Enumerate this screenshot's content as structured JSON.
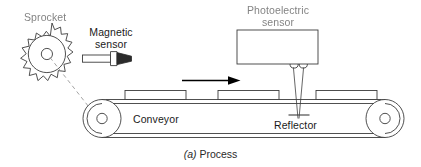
{
  "figure": {
    "caption_prefix": "(a)",
    "caption_text": "Process",
    "caption_full": "(a) Process"
  },
  "labels": {
    "sprocket": "Sprocket",
    "magnetic_sensor_line1": "Magnetic",
    "magnetic_sensor_line2": "sensor",
    "photoelectric_line1": "Photoelectric",
    "photoelectric_line2": "sensor",
    "conveyor": "Conveyor",
    "reflector": "Reflector"
  },
  "components": {
    "sprocket_teeth": 18,
    "conveyor_packages": 3,
    "conveyor_pulleys": 2,
    "direction_arrow": "right",
    "beam_rays": 2
  },
  "colors": {
    "line": "#3c3c3c",
    "text": "#1a1a1a",
    "dashed": "#8a8a8a",
    "arrow": "#000000",
    "background": "#ffffff",
    "sensor_tip": "#2b2b2b"
  }
}
